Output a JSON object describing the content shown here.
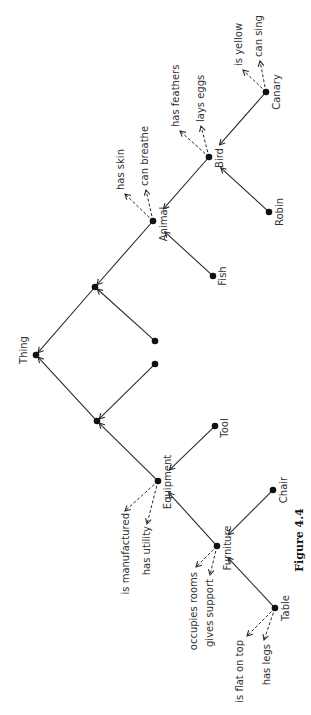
{
  "figure": {
    "caption": "Figure 4.4",
    "rotation": -90,
    "caption_pos": [
      303,
      540
    ]
  },
  "nodes": [
    {
      "id": "canary",
      "label": "Canary",
      "x": 266,
      "y": 92,
      "lx": 280,
      "ly": 92
    },
    {
      "id": "bird",
      "label": "Bird",
      "x": 209,
      "y": 157,
      "lx": 223,
      "ly": 158
    },
    {
      "id": "robin",
      "label": "Robin",
      "x": 269,
      "y": 212,
      "lx": 283,
      "ly": 212
    },
    {
      "id": "animal",
      "label": "Animal",
      "x": 153,
      "y": 221,
      "lx": 167,
      "ly": 224
    },
    {
      "id": "fish",
      "label": "Fish",
      "x": 213,
      "y": 276,
      "lx": 226,
      "ly": 276
    },
    {
      "id": "junction-upper",
      "label": "",
      "x": 95,
      "y": 287
    },
    {
      "id": "unnamed-1",
      "label": "",
      "x": 155,
      "y": 341
    },
    {
      "id": "thing",
      "label": "Thing",
      "x": 36,
      "y": 355,
      "lx": 27,
      "ly": 350
    },
    {
      "id": "unnamed-2",
      "label": "",
      "x": 155,
      "y": 364
    },
    {
      "id": "junction-lower",
      "label": "",
      "x": 97,
      "y": 421
    },
    {
      "id": "tool",
      "label": "Tool",
      "x": 215,
      "y": 426,
      "lx": 228,
      "ly": 428
    },
    {
      "id": "equipment",
      "label": "Equipment",
      "x": 158,
      "y": 481,
      "lx": 171,
      "ly": 482
    },
    {
      "id": "chair",
      "label": "Chair",
      "x": 273,
      "y": 490,
      "lx": 287,
      "ly": 490
    },
    {
      "id": "furniture",
      "label": "Furniture",
      "x": 217,
      "y": 546,
      "lx": 231,
      "ly": 548
    },
    {
      "id": "table",
      "label": "Table",
      "x": 275,
      "y": 608,
      "lx": 289,
      "ly": 608
    }
  ],
  "isa_edges": [
    {
      "from": "canary",
      "to": "bird"
    },
    {
      "from": "robin",
      "to": "bird"
    },
    {
      "from": "bird",
      "to": "animal"
    },
    {
      "from": "fish",
      "to": "animal"
    },
    {
      "from": "animal",
      "to": "junction-upper"
    },
    {
      "from": "unnamed-1",
      "to": "junction-upper"
    },
    {
      "from": "junction-upper",
      "to": "thing"
    },
    {
      "from": "junction-lower",
      "to": "thing"
    },
    {
      "from": "unnamed-2",
      "to": "junction-lower"
    },
    {
      "from": "equipment",
      "to": "junction-lower"
    },
    {
      "from": "tool",
      "to": "equipment"
    },
    {
      "from": "furniture",
      "to": "equipment"
    },
    {
      "from": "chair",
      "to": "furniture"
    },
    {
      "from": "table",
      "to": "furniture"
    }
  ],
  "properties": [
    {
      "node": "canary",
      "label": "is yellow",
      "tip": [
        243,
        70
      ],
      "tx": 242,
      "ty": 66
    },
    {
      "node": "canary",
      "label": "can sing",
      "tip": [
        260,
        61
      ],
      "tx": 262,
      "ty": 57
    },
    {
      "node": "bird",
      "label": "has feathers",
      "tip": [
        180,
        131
      ],
      "tx": 179,
      "ty": 127
    },
    {
      "node": "bird",
      "label": "lays eggs",
      "tip": [
        201,
        126
      ],
      "tx": 204,
      "ty": 122
    },
    {
      "node": "animal",
      "label": "has skin",
      "tip": [
        125,
        194
      ],
      "tx": 124,
      "ty": 190
    },
    {
      "node": "animal",
      "label": "can breathe",
      "tip": [
        146,
        190
      ],
      "tx": 148,
      "ty": 186
    },
    {
      "node": "equipment",
      "label": "is manufactured",
      "tip": [
        125,
        511
      ],
      "tx": 129,
      "ty": 513
    },
    {
      "node": "equipment",
      "label": "has utility",
      "tip": [
        147,
        524
      ],
      "tx": 150,
      "ty": 526
    },
    {
      "node": "furniture",
      "label": "occupies rooms",
      "tip": [
        196,
        567
      ],
      "tx": 197,
      "ty": 572
    },
    {
      "node": "furniture",
      "label": "gives support",
      "tip": [
        210,
        575
      ],
      "tx": 213,
      "ty": 579
    },
    {
      "node": "table",
      "label": "is flat on top",
      "tip": [
        247,
        636
      ],
      "tx": 243,
      "ty": 640
    },
    {
      "node": "table",
      "label": "has legs",
      "tip": [
        264,
        640
      ],
      "tx": 270,
      "ty": 644
    }
  ]
}
